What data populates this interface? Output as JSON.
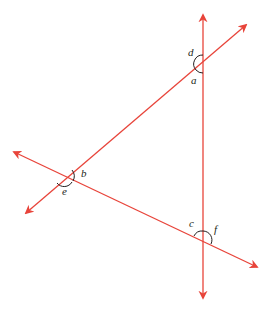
{
  "diagram": {
    "colors": {
      "line": "#e8443a",
      "arc": "#231f20",
      "label": "#231f20",
      "background": "#ffffff"
    },
    "lines": [
      {
        "name": "vertical-line",
        "from": [
          203,
          298
        ],
        "to": [
          203,
          15
        ]
      },
      {
        "name": "ascending-line",
        "from": [
          26,
          213
        ],
        "to": [
          246,
          25
        ]
      },
      {
        "name": "descending-line",
        "from": [
          14,
          152
        ],
        "to": [
          257,
          267
        ]
      }
    ],
    "intersections": [
      {
        "name": "top-vertex",
        "point": [
          203,
          64
        ]
      },
      {
        "name": "left-vertex",
        "point": [
          64,
          177
        ]
      },
      {
        "name": "bottom-vertex",
        "point": [
          203,
          240
        ]
      }
    ],
    "angle_labels": {
      "a": "a",
      "b": "b",
      "c": "c",
      "d": "d",
      "e": "e",
      "f": "f"
    }
  }
}
